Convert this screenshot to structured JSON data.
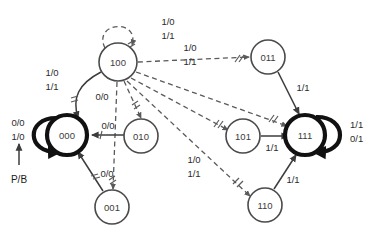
{
  "diagram": {
    "type": "state-transition-diagram",
    "colors": {
      "background": "#ffffff",
      "normal_stroke": "#4a4a4a",
      "bold_stroke": "#111111",
      "dashed_stroke": "#5a5a5a",
      "text": "#2b2b2b"
    },
    "states": [
      {
        "id": "s100",
        "label": "100",
        "cx": 118,
        "cy": 62,
        "r": 19,
        "emphasis": "normal"
      },
      {
        "id": "s000",
        "label": "000",
        "cx": 67,
        "cy": 135,
        "r": 20,
        "emphasis": "bold"
      },
      {
        "id": "s010",
        "label": "010",
        "cx": 141,
        "cy": 136,
        "r": 17,
        "emphasis": "normal"
      },
      {
        "id": "s001",
        "label": "001",
        "cx": 112,
        "cy": 207,
        "r": 17,
        "emphasis": "normal"
      },
      {
        "id": "s011",
        "label": "011",
        "cx": 268,
        "cy": 57,
        "r": 17,
        "emphasis": "normal"
      },
      {
        "id": "s101",
        "label": "101",
        "cx": 243,
        "cy": 136,
        "r": 17,
        "emphasis": "normal"
      },
      {
        "id": "s110",
        "label": "110",
        "cx": 265,
        "cy": 205,
        "r": 17,
        "emphasis": "normal"
      },
      {
        "id": "s111",
        "label": "111",
        "cx": 305,
        "cy": 135,
        "r": 20,
        "emphasis": "bold"
      }
    ],
    "reset": {
      "arrow_label": "P/B",
      "input_labels": [
        "0/0",
        "1/0"
      ]
    },
    "labels": {
      "self_100_a": "1/0",
      "self_100_b": "1/1",
      "to011_a": "1/0",
      "to011_b": "1/1",
      "from100_000": "0/0",
      "from010_000": "0/0",
      "from001_000": "0/0",
      "left_pair_a": "1/0",
      "left_pair_b": "1/1",
      "mid_pair_a": "1/0",
      "mid_pair_b": "1/1",
      "self_111_a": "1/1",
      "self_111_b": "0/1",
      "from011_111": "1/1",
      "from101_111": "1/1",
      "from110_111": "1/1"
    }
  }
}
